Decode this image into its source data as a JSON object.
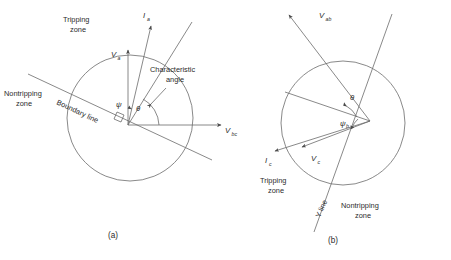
{
  "figure": {
    "type": "mho-relay-characteristic-diagram",
    "panels": [
      {
        "id": "a",
        "caption": "(a)",
        "caption_x": 110,
        "caption_y": 238,
        "circle": {
          "cx": 130,
          "cy": 118,
          "r": 63
        },
        "origin": {
          "x": 128,
          "y": 125
        },
        "zones": [
          {
            "name": "tripping-zone",
            "line1": "Tripping",
            "line2": "zone",
            "x": 63,
            "y": 22
          },
          {
            "name": "nontripping-zone",
            "line1": "Nontripping",
            "line2": "zone",
            "x": 6,
            "y": 96
          }
        ],
        "annotations": [
          {
            "name": "boundary-line-label",
            "text": "Boundary line",
            "x": 56,
            "y": 104,
            "rotate": 25
          },
          {
            "name": "characteristic-angle-label",
            "line1": "Characteristic",
            "line2": "angle",
            "x": 152,
            "y": 72
          }
        ],
        "vectors": [
          {
            "name": "va-vector",
            "label": "V",
            "sub": "a",
            "lx": 111,
            "ly": 57,
            "x1": 128,
            "y1": 125,
            "x2": 128,
            "y2": 48
          },
          {
            "name": "ia-vector",
            "label": "I",
            "sub": "a",
            "lx": 145,
            "ly": 17,
            "x1": 128,
            "y1": 125,
            "x2": 152,
            "y2": 24
          },
          {
            "name": "vbc-axis",
            "label": "V",
            "sub": "bc",
            "lx": 226,
            "ly": 131,
            "x1": 128,
            "y1": 125,
            "x2": 222,
            "y2": 125
          }
        ],
        "angles": [
          {
            "name": "psi-angle-label",
            "symbol": "ψ",
            "x": 117,
            "y": 106
          },
          {
            "name": "theta-angle-label",
            "symbol": "θ",
            "x": 137,
            "y": 110
          }
        ]
      },
      {
        "id": "b",
        "caption": "(b)",
        "caption_x": 330,
        "caption_y": 243,
        "circle": {
          "cx": 343,
          "cy": 123,
          "r": 62
        },
        "origin": {
          "x": 370,
          "y": 121
        },
        "zones": [
          {
            "name": "tripping-zone",
            "line1": "Tripping",
            "line2": "zone",
            "x": 262,
            "y": 183
          },
          {
            "name": "nontripping-zone",
            "line1": "Nontripping",
            "line2": "zone",
            "x": 344,
            "y": 208
          }
        ],
        "annotations": [
          {
            "name": "y-line-label",
            "text": "Y line",
            "x": 325,
            "y": 216,
            "rotate": -65
          }
        ],
        "vectors": [
          {
            "name": "vab-vector",
            "label": "V",
            "sub": "ab",
            "lx": 322,
            "ly": 17,
            "x1": 370,
            "y1": 121,
            "x2": 287,
            "y2": 12
          },
          {
            "name": "ic-vector",
            "label": "I",
            "sub": "c",
            "lx": 266,
            "ly": 162,
            "x1": 370,
            "y1": 121,
            "x2": 273,
            "y2": 152
          },
          {
            "name": "vc-vector",
            "label": "V",
            "sub": "c",
            "lx": 314,
            "ly": 160,
            "x1": 370,
            "y1": 121,
            "x2": 300,
            "y2": 148
          }
        ],
        "angles": [
          {
            "name": "theta-angle-label",
            "symbol": "θ",
            "x": 353,
            "y": 99
          },
          {
            "name": "psi-angle-label",
            "symbol": "ψ",
            "x": 345,
            "y": 122
          }
        ]
      }
    ],
    "shared_axis": {
      "name": "vbc-axis-right",
      "label": "V",
      "sub": "bc",
      "lx": 228,
      "ly": 128
    },
    "colors": {
      "stroke": "#6b6b6b",
      "text": "#2b2b2b",
      "background": "#ffffff"
    }
  }
}
